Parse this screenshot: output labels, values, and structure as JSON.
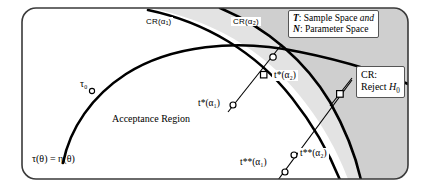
{
  "figure": {
    "name": "hypothesis-testing-acceptance-region-diagram",
    "frame": {
      "border_color": "#333333",
      "background": "#ffffff",
      "corner_radius": 14
    },
    "colors": {
      "shade_dark": "#cccccc",
      "shade_light": "#e2e2e2",
      "curve": "#000000",
      "text": "#000000",
      "box_border": "#555555"
    }
  },
  "legend": {
    "line1_symbol": "T",
    "line1_text": ": Sample Space ",
    "line1_emph": "and",
    "line2_symbol": "N",
    "line2_text": ": Parameter Space"
  },
  "labels": {
    "cr_alpha1": "CR(α₁)",
    "cr_alpha2": "CR(α₂)",
    "acceptance_region": "Acceptance Region",
    "tau_zero": "τ₀",
    "tau_eta": "τ(θ) = η(θ)",
    "t_star_alpha1": "t*(α₁)",
    "t_star_alpha2": "t*(α₂)",
    "t_dstar_alpha1": "t**(α₁)",
    "t_dstar_alpha2": "t**(α₂)",
    "cr_reject_line1": "CR:",
    "cr_reject_line2_prefix": "Reject ",
    "cr_reject_line2_symbol": "H",
    "cr_reject_line2_sub": "0"
  },
  "markers": [
    {
      "name": "tau-zero-point",
      "x": 92,
      "y": 91,
      "shape": "circle"
    },
    {
      "name": "t-star-alpha1-point",
      "x": 233,
      "y": 105,
      "shape": "circle"
    },
    {
      "name": "t-star-alpha2-point",
      "x": 264,
      "y": 75,
      "shape": "square"
    },
    {
      "name": "upper-intersection-point",
      "x": 273,
      "y": 57,
      "shape": "circle"
    },
    {
      "name": "cr-reject-point",
      "x": 340,
      "y": 94,
      "shape": "square"
    },
    {
      "name": "t-dstar-alpha1-point",
      "x": 284,
      "y": 172,
      "shape": "circle"
    },
    {
      "name": "t-dstar-alpha2-point",
      "x": 294,
      "y": 155,
      "shape": "circle"
    }
  ]
}
